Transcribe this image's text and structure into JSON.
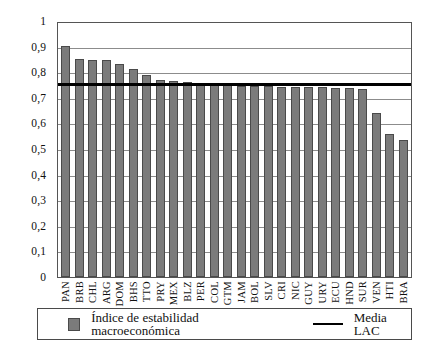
{
  "chart_data": {
    "type": "bar",
    "title": "",
    "xlabel": "",
    "ylabel": "",
    "ylim": [
      0,
      1
    ],
    "grid": true,
    "legend_position": "bottom",
    "categories": [
      "PAN",
      "BRB",
      "CHL",
      "ARG",
      "DOM",
      "BHS",
      "TTO",
      "PRY",
      "MEX",
      "BLZ",
      "PER",
      "COL",
      "GTM",
      "JAM",
      "BOL",
      "SLV",
      "CRI",
      "NIC",
      "GUY",
      "URY",
      "ECU",
      "HND",
      "SUR",
      "VEN",
      "HTI",
      "BRA"
    ],
    "series": [
      {
        "name": "Índice de estabilidad macroeconómica",
        "type": "bar",
        "color": "#7b7b7b",
        "values": [
          0.91,
          0.86,
          0.855,
          0.853,
          0.838,
          0.818,
          0.795,
          0.775,
          0.773,
          0.768,
          0.762,
          0.758,
          0.755,
          0.753,
          0.752,
          0.751,
          0.75,
          0.749,
          0.748,
          0.747,
          0.746,
          0.745,
          0.74,
          0.645,
          0.562,
          0.54
        ]
      },
      {
        "name": "Media LAC",
        "type": "line",
        "color": "#000000",
        "value": 0.757
      }
    ],
    "yticks": [
      "0",
      "0,1",
      "0,2",
      "0,3",
      "0,4",
      "0,5",
      "0,6",
      "0,7",
      "0,8",
      "0,9",
      "1"
    ],
    "ytick_values": [
      0,
      0.1,
      0.2,
      0.3,
      0.4,
      0.5,
      0.6,
      0.7,
      0.8,
      0.9,
      1
    ]
  },
  "legend": {
    "series_label": "Índice de estabilidad macroeconómica",
    "mean_label": "Media LAC",
    "swatch_name": "bar-swatch",
    "line_name": "mean-line-swatch"
  },
  "colors": {
    "bar_fill": "#7b7b7b",
    "bar_stroke": "#4a4a4a",
    "mean_line": "#000000",
    "grid": "#8c8c8c",
    "frame": "#555555",
    "background": "#ffffff"
  }
}
